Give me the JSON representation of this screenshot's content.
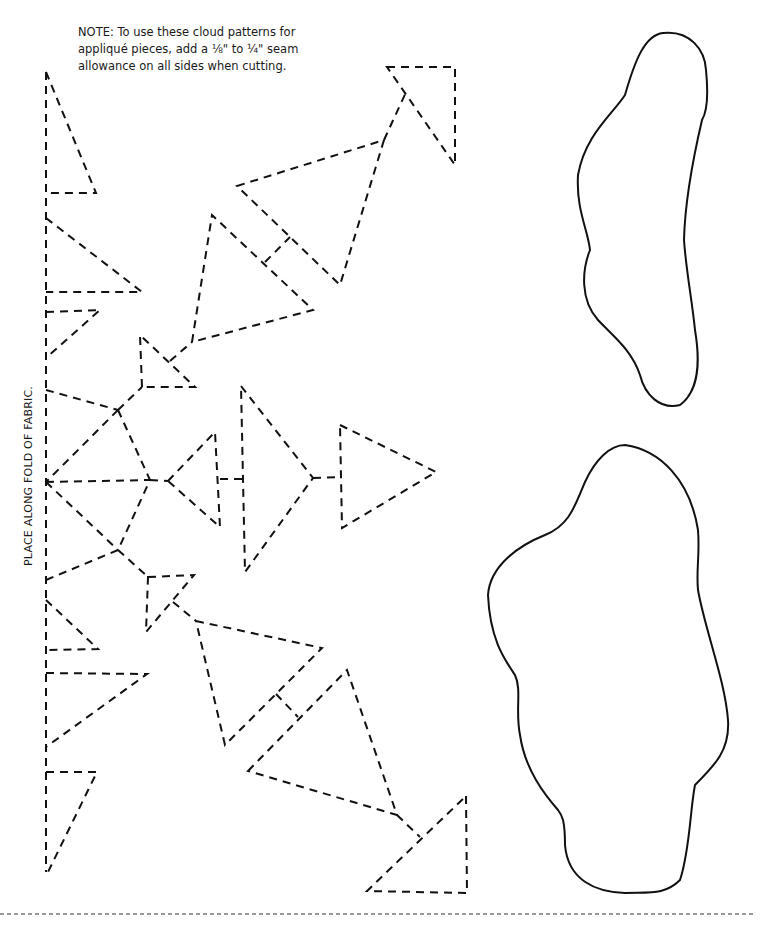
{
  "note": {
    "lines": [
      "NOTE: To use these cloud patterns for",
      "appliqué pieces, add a ⅛\" to ¼\" seam",
      "allowance on all sides when cutting."
    ]
  },
  "fold_label": "PLACE ALONG FOLD OF FABRIC.",
  "pattern_pieces": {
    "snowflake_half": "dashed-line snowflake pattern (half, placed on fold)",
    "cloud_small": "small cloud outline",
    "cloud_large": "large cloud outline"
  },
  "colors": {
    "line": "#111111",
    "background": "#ffffff"
  }
}
